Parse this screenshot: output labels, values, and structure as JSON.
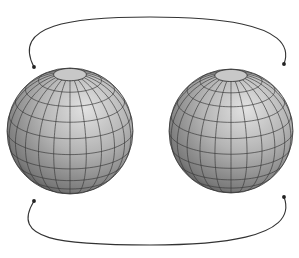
{
  "diagram": {
    "background": "#ffffff",
    "spheres": [
      {
        "id": "left-sphere",
        "cx": 70,
        "cy": 131,
        "r": 63
      },
      {
        "id": "right-sphere",
        "cx": 231,
        "cy": 131,
        "r": 62
      }
    ],
    "sphere_style": {
      "fill_light": "#dcdcdc",
      "fill_mid": "#a9a9a9",
      "fill_dark": "#555555",
      "grid_color": "#3a3a3a",
      "latitudes": 12,
      "longitudes": 24,
      "tilt_deg": 22,
      "polar_cap_fill": "#c8c8c8"
    },
    "arrows": [
      {
        "id": "top-arrow",
        "from": "right",
        "to": "left",
        "path": "M 284 64 C 300 20, 200 17, 150 17 C 70 17, 12 25, 34 67",
        "head_at": "left"
      },
      {
        "id": "bottom-arrow",
        "from": "right",
        "to": "left",
        "path": "M 284 197 C 300 240, 210 245, 150 245 C 60 245, 10 240, 34 201",
        "head_at": "both-dots"
      }
    ],
    "arrow_color": "#333333"
  }
}
